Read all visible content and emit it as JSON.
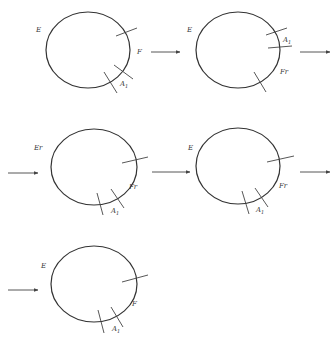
{
  "colors": {
    "stroke": "#333333",
    "background": "#ffffff"
  },
  "diagrams": [
    {
      "id": 1,
      "labels": {
        "left": "E",
        "right": "F",
        "cut": "A",
        "cut_sub": "1"
      }
    },
    {
      "id": 2,
      "labels": {
        "left": "E",
        "right": "Fr",
        "cut": "A",
        "cut_sub": "1"
      }
    },
    {
      "id": 3,
      "labels": {
        "left": "Er",
        "right": "Fr",
        "cut": "A",
        "cut_sub": "1"
      }
    },
    {
      "id": 4,
      "labels": {
        "left": "E",
        "right": "Fr",
        "cut": "A",
        "cut_sub": "1"
      }
    },
    {
      "id": 5,
      "labels": {
        "left": "E",
        "right": "F",
        "cut": "A",
        "cut_sub": "1"
      }
    }
  ],
  "arrows": [
    {
      "from": "diagram-1",
      "to": "diagram-2"
    },
    {
      "from": "diagram-2",
      "to": "diagram-3"
    },
    {
      "from": "diagram-3",
      "to": "diagram-4"
    },
    {
      "from": "diagram-4",
      "to": "diagram-5"
    }
  ]
}
